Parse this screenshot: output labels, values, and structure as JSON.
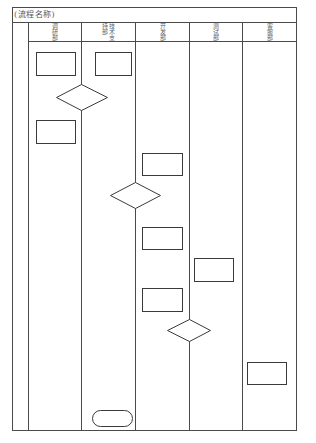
{
  "diagram": {
    "title": "(流程名称)",
    "lanes": [
      {
        "label": "调研部"
      },
      {
        "label": "技术支持部"
      },
      {
        "label": "开发部"
      },
      {
        "label": "测试部"
      },
      {
        "label": "客服部"
      }
    ],
    "nodes": [
      {
        "id": "n1",
        "type": "process",
        "lane": "调研部",
        "text": ""
      },
      {
        "id": "n2",
        "type": "process",
        "lane": "技术支持部",
        "text": ""
      },
      {
        "id": "d1",
        "type": "decision",
        "lane": "调研部/技术支持部",
        "text": ""
      },
      {
        "id": "n3",
        "type": "process",
        "lane": "调研部",
        "text": ""
      },
      {
        "id": "n4",
        "type": "process",
        "lane": "开发部",
        "text": ""
      },
      {
        "id": "d2",
        "type": "decision",
        "lane": "技术支持部/开发部",
        "text": ""
      },
      {
        "id": "n5",
        "type": "process",
        "lane": "开发部",
        "text": ""
      },
      {
        "id": "n6",
        "type": "process",
        "lane": "测试部",
        "text": ""
      },
      {
        "id": "n7",
        "type": "process",
        "lane": "开发部",
        "text": ""
      },
      {
        "id": "d3",
        "type": "decision",
        "lane": "开发部/测试部",
        "text": ""
      },
      {
        "id": "n8",
        "type": "process",
        "lane": "客服部",
        "text": ""
      },
      {
        "id": "t1",
        "type": "terminator",
        "lane": "技术支持部",
        "text": ""
      }
    ],
    "colors": {
      "line": "#3a3a3a",
      "background": "#ffffff"
    }
  }
}
